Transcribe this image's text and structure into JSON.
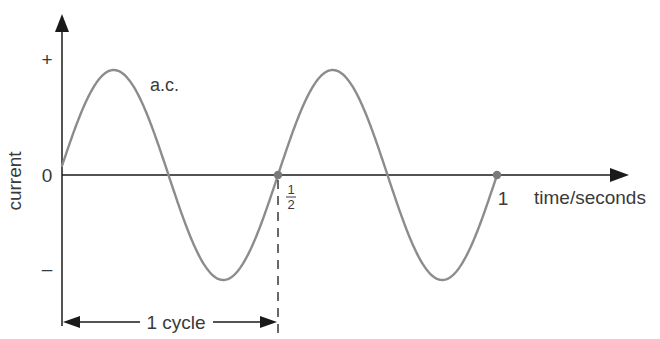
{
  "diagram": {
    "y_axis": {
      "label": "current",
      "ticks": {
        "plus": "+",
        "zero": "0",
        "minus": "–"
      }
    },
    "x_axis": {
      "label": "time/seconds",
      "ticks": [
        {
          "num": "1",
          "den": "2",
          "value": 0.5
        },
        {
          "text": "1",
          "value": 1
        }
      ]
    },
    "curve_label": "a.c.",
    "cycle_label": "1 cycle",
    "colors": {
      "curve": "#8c8c8c",
      "axes": "#1a1a1a",
      "marker": "#7a7a7a",
      "text": "#3a3a3a"
    }
  },
  "chart_data": {
    "type": "line",
    "title": "",
    "xlabel": "time/seconds",
    "ylabel": "current",
    "series": [
      {
        "name": "a.c.",
        "function": "sine",
        "period_s": 0.5,
        "amplitude": "peak (+ to –)",
        "cycles_shown": 2
      }
    ],
    "x_ticks": [
      "1/2",
      "1"
    ],
    "y_ticks": [
      "+",
      "0",
      "–"
    ],
    "markers": [
      {
        "x": 0.5,
        "y": 0
      },
      {
        "x": 1,
        "y": 0
      }
    ],
    "annotations": [
      "a.c.",
      "1 cycle"
    ],
    "grid": false
  }
}
